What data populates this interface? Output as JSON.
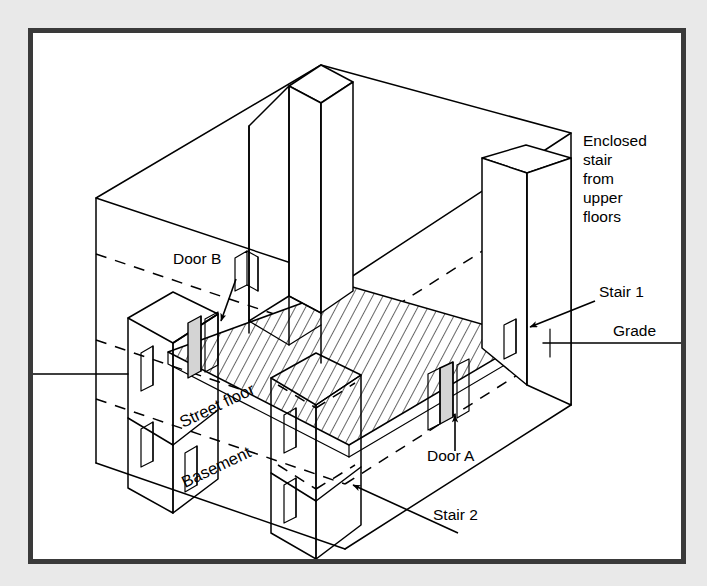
{
  "figure": {
    "type": "isometric-architectural-section",
    "background_color": "#e9e9e9",
    "frame_color": "#3a3a3a",
    "paper_color": "#ffffff",
    "line_color": "#000000",
    "door_fill_color": "#d4d4d4"
  },
  "labels": {
    "enclosed_stair": {
      "lines": [
        "Enclosed",
        "stair",
        "from",
        "upper",
        "floors"
      ],
      "x": 578,
      "y": 137
    },
    "stair_1": {
      "text": "Stair 1",
      "x": 578,
      "y": 289
    },
    "grade": {
      "text": "Grade",
      "x": 608,
      "y": 328
    },
    "stair_2": {
      "text": "Stair 2",
      "x": 428,
      "y": 508
    },
    "door_a": {
      "text": "Door A",
      "x": 428,
      "y": 441
    },
    "door_b": {
      "text": "Door B",
      "x": 162,
      "y": 256
    },
    "street_floor": {
      "text": "Street floor",
      "x": 176,
      "y": 414,
      "rotation": -26
    },
    "basement": {
      "text": "Basement",
      "x": 176,
      "y": 474,
      "rotation": -26
    }
  },
  "elements": {
    "outer_box": "building envelope wireframe",
    "center_shaft": "central enclosed stair shaft rising through upper floors",
    "right_tower": "Stair 1 enclosure at right face",
    "left_enclosure": "Stair 2 / basement stair enclosure at left",
    "mid_enclosure": "basement stair enclosure at center-front",
    "hatched_slab": "street floor slab (hatched)",
    "grade_line": "horizontal grade reference line at right",
    "left_grade_line": "horizontal grade reference line at left"
  }
}
